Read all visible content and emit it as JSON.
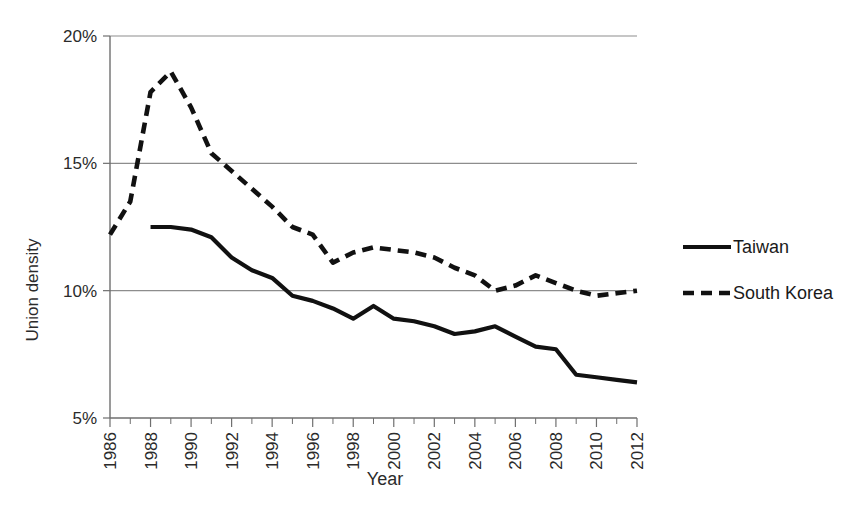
{
  "chart_data": {
    "type": "line",
    "title": "",
    "xlabel": "Year",
    "ylabel": "Union density",
    "xlim": [
      1986,
      2012
    ],
    "ylim": [
      5,
      20
    ],
    "ytick_labels": [
      "20%",
      "15%",
      "10%",
      "5%"
    ],
    "ytick_values": [
      20,
      15,
      10,
      5
    ],
    "ytick_suffix": "%",
    "grid": "horizontal",
    "legend_position": "right",
    "x": [
      1986,
      1987,
      1988,
      1989,
      1990,
      1991,
      1992,
      1993,
      1994,
      1995,
      1996,
      1997,
      1998,
      1999,
      2000,
      2001,
      2002,
      2003,
      2004,
      2005,
      2006,
      2007,
      2008,
      2009,
      2010,
      2011,
      2012
    ],
    "xtick_labels": [
      "1986",
      "1988",
      "1990",
      "1992",
      "1994",
      "1996",
      "1998",
      "2000",
      "2002",
      "2004",
      "2006",
      "2008",
      "2010",
      "2012"
    ],
    "xtick_values": [
      1986,
      1988,
      1990,
      1992,
      1994,
      1996,
      1998,
      2000,
      2002,
      2004,
      2006,
      2008,
      2010,
      2012
    ],
    "xtick_minor_values": [
      1987,
      1989,
      1991,
      1993,
      1995,
      1997,
      1999,
      2001,
      2003,
      2005,
      2007,
      2009,
      2011
    ],
    "series": [
      {
        "name": "Taiwan",
        "style": "solid",
        "color": "#111111",
        "x": [
          1988,
          1989,
          1990,
          1991,
          1992,
          1993,
          1994,
          1995,
          1996,
          1997,
          1998,
          1999,
          2000,
          2001,
          2002,
          2003,
          2004,
          2005,
          2006,
          2007,
          2008,
          2009,
          2010,
          2011,
          2012
        ],
        "values": [
          12.5,
          12.5,
          12.4,
          12.1,
          11.3,
          10.8,
          10.5,
          9.8,
          9.6,
          9.3,
          8.9,
          9.4,
          8.9,
          8.8,
          8.6,
          8.3,
          8.4,
          8.6,
          8.2,
          7.8,
          7.7,
          6.7,
          6.6,
          6.5,
          6.4
        ]
      },
      {
        "name": "South Korea",
        "style": "dashed",
        "color": "#111111",
        "x": [
          1986,
          1987,
          1988,
          1989,
          1990,
          1991,
          1992,
          1993,
          1994,
          1995,
          1996,
          1997,
          1998,
          1999,
          2000,
          2001,
          2002,
          2003,
          2004,
          2005,
          2006,
          2007,
          2008,
          2009,
          2010,
          2011,
          2012
        ],
        "values": [
          12.2,
          13.5,
          17.8,
          18.6,
          17.2,
          15.4,
          14.7,
          14.0,
          13.3,
          12.5,
          12.2,
          11.1,
          11.5,
          11.7,
          11.6,
          11.5,
          11.3,
          10.9,
          10.6,
          10.0,
          10.2,
          10.6,
          10.3,
          10.0,
          9.8,
          9.9,
          10.0
        ]
      }
    ],
    "legend": [
      {
        "label": "Taiwan",
        "style": "solid"
      },
      {
        "label": "South Korea",
        "style": "dashed"
      }
    ]
  }
}
